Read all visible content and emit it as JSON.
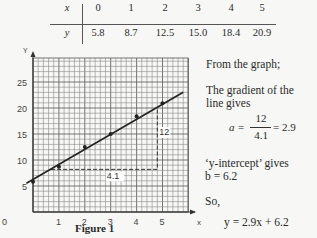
{
  "table": {
    "row_x_label": "x",
    "row_y_label": "y",
    "x_values": [
      "0",
      "1",
      "2",
      "3",
      "4",
      "5"
    ],
    "y_values": [
      "5.8",
      "8.7",
      "12.5",
      "15.0",
      "18.4",
      "20.9"
    ]
  },
  "figure": {
    "caption": "Figure 1",
    "x_axis_label": "x",
    "y_axis_label": "y",
    "triangle_run_label": "4.1",
    "triangle_rise_label": "12"
  },
  "explanation": {
    "line1": "From the graph;",
    "line2": "The gradient of the",
    "line3": "line gives",
    "gradient_lhs": "a =",
    "gradient_num": "12",
    "gradient_den": "4.1",
    "gradient_rhs": "= 2.9",
    "intercept_line": "‘y-intercept’ gives",
    "intercept_value": "b = 6.2",
    "so_label": "So,",
    "equation": "y = 2.9x + 6.2"
  },
  "chart_data": {
    "type": "scatter",
    "title": "Figure 1",
    "xlabel": "x",
    "ylabel": "y",
    "x": [
      0,
      1,
      2,
      3,
      4,
      5
    ],
    "y": [
      5.8,
      8.7,
      12.5,
      15.0,
      18.4,
      20.9
    ],
    "fit_line": {
      "slope": 2.9,
      "intercept": 6.2,
      "x_range": [
        -0.1,
        5.8
      ]
    },
    "gradient_triangle": {
      "x0": 0.7,
      "x1": 4.8,
      "y0": 8.2,
      "y1": 20.2,
      "run_label": "4.1",
      "rise_label": "12"
    },
    "x_ticks": [
      0,
      1,
      2,
      3,
      4,
      5
    ],
    "y_ticks": [
      5,
      10,
      15,
      20,
      25
    ],
    "xlim": [
      0,
      6
    ],
    "ylim": [
      0,
      29.6
    ],
    "grid": true,
    "minor_divisions_per_unit_x": 5,
    "minor_step_y": 1
  }
}
